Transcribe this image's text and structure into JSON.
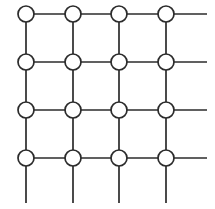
{
  "figure": {
    "type": "lattice-diagram",
    "width": 215,
    "height": 209,
    "background_color": "#ffffff"
  },
  "style": {
    "line_color": "#2b2b2b",
    "line_width": 1.7,
    "node_fill": "#ffffff",
    "node_stroke": "#2b2b2b",
    "node_stroke_width": 1.7,
    "node_radius": 8
  },
  "chart_data": {
    "type": "scatter",
    "xlabel": "",
    "ylabel": "",
    "rows": 4,
    "columns": 4,
    "column_x": [
      26,
      73,
      119,
      166
    ],
    "row_y": [
      14,
      62,
      110,
      158
    ],
    "node_count": 16,
    "nodes": [
      {
        "id": "n-r1c1",
        "row": 1,
        "col": 1,
        "x": 26,
        "y": 14
      },
      {
        "id": "n-r1c2",
        "row": 1,
        "col": 2,
        "x": 73,
        "y": 14
      },
      {
        "id": "n-r1c3",
        "row": 1,
        "col": 3,
        "x": 119,
        "y": 14
      },
      {
        "id": "n-r1c4",
        "row": 1,
        "col": 4,
        "x": 166,
        "y": 14
      },
      {
        "id": "n-r2c1",
        "row": 2,
        "col": 1,
        "x": 26,
        "y": 62
      },
      {
        "id": "n-r2c2",
        "row": 2,
        "col": 2,
        "x": 73,
        "y": 62
      },
      {
        "id": "n-r2c3",
        "row": 2,
        "col": 3,
        "x": 119,
        "y": 62
      },
      {
        "id": "n-r2c4",
        "row": 2,
        "col": 4,
        "x": 166,
        "y": 62
      },
      {
        "id": "n-r3c1",
        "row": 3,
        "col": 1,
        "x": 26,
        "y": 110
      },
      {
        "id": "n-r3c2",
        "row": 3,
        "col": 2,
        "x": 73,
        "y": 110
      },
      {
        "id": "n-r3c3",
        "row": 3,
        "col": 3,
        "x": 119,
        "y": 110
      },
      {
        "id": "n-r3c4",
        "row": 3,
        "col": 4,
        "x": 166,
        "y": 110
      },
      {
        "id": "n-r4c1",
        "row": 4,
        "col": 1,
        "x": 26,
        "y": 158
      },
      {
        "id": "n-r4c2",
        "row": 4,
        "col": 2,
        "x": 73,
        "y": 158
      },
      {
        "id": "n-r4c3",
        "row": 4,
        "col": 3,
        "x": 119,
        "y": 158
      },
      {
        "id": "n-r4c4",
        "row": 4,
        "col": 4,
        "x": 166,
        "y": 158
      }
    ],
    "horizontal_edges": [
      {
        "id": "h-r1-c1c2",
        "x1": 26,
        "y1": 14,
        "x2": 73,
        "y2": 14
      },
      {
        "id": "h-r1-c2c3",
        "x1": 73,
        "y1": 14,
        "x2": 119,
        "y2": 14
      },
      {
        "id": "h-r1-c3c4",
        "x1": 119,
        "y1": 14,
        "x2": 166,
        "y2": 14
      },
      {
        "id": "h-r2-c1c2",
        "x1": 26,
        "y1": 62,
        "x2": 73,
        "y2": 62
      },
      {
        "id": "h-r2-c2c3",
        "x1": 73,
        "y1": 62,
        "x2": 119,
        "y2": 62
      },
      {
        "id": "h-r2-c3c4",
        "x1": 119,
        "y1": 62,
        "x2": 166,
        "y2": 62
      },
      {
        "id": "h-r3-c1c2",
        "x1": 26,
        "y1": 110,
        "x2": 73,
        "y2": 110
      },
      {
        "id": "h-r3-c2c3",
        "x1": 73,
        "y1": 110,
        "x2": 119,
        "y2": 110
      },
      {
        "id": "h-r3-c3c4",
        "x1": 119,
        "y1": 110,
        "x2": 166,
        "y2": 110
      },
      {
        "id": "h-r4-c1c2",
        "x1": 26,
        "y1": 158,
        "x2": 73,
        "y2": 158
      },
      {
        "id": "h-r4-c2c3",
        "x1": 73,
        "y1": 158,
        "x2": 119,
        "y2": 158
      },
      {
        "id": "h-r4-c3c4",
        "x1": 119,
        "y1": 158,
        "x2": 166,
        "y2": 158
      }
    ],
    "vertical_edges": [
      {
        "id": "v-c1-r1r2",
        "x1": 26,
        "y1": 14,
        "x2": 26,
        "y2": 62
      },
      {
        "id": "v-c1-r2r3",
        "x1": 26,
        "y1": 62,
        "x2": 26,
        "y2": 110
      },
      {
        "id": "v-c1-r3r4",
        "x1": 26,
        "y1": 110,
        "x2": 26,
        "y2": 158
      },
      {
        "id": "v-c2-r1r2",
        "x1": 73,
        "y1": 14,
        "x2": 73,
        "y2": 62
      },
      {
        "id": "v-c2-r2r3",
        "x1": 73,
        "y1": 62,
        "x2": 73,
        "y2": 110
      },
      {
        "id": "v-c2-r3r4",
        "x1": 73,
        "y1": 110,
        "x2": 73,
        "y2": 158
      },
      {
        "id": "v-c3-r1r2",
        "x1": 119,
        "y1": 14,
        "x2": 119,
        "y2": 62
      },
      {
        "id": "v-c3-r2r3",
        "x1": 119,
        "y1": 62,
        "x2": 119,
        "y2": 110
      },
      {
        "id": "v-c3-r3r4",
        "x1": 119,
        "y1": 110,
        "x2": 119,
        "y2": 158
      },
      {
        "id": "v-c4-r1r2",
        "x1": 166,
        "y1": 14,
        "x2": 166,
        "y2": 62
      },
      {
        "id": "v-c4-r2r3",
        "x1": 166,
        "y1": 62,
        "x2": 166,
        "y2": 110
      },
      {
        "id": "v-c4-r3r4",
        "x1": 166,
        "y1": 110,
        "x2": 166,
        "y2": 158
      }
    ],
    "dangling_stubs": [
      {
        "id": "stub-right-r1",
        "direction": "right",
        "x1": 166,
        "y1": 14,
        "x2": 207,
        "y2": 14
      },
      {
        "id": "stub-right-r2",
        "direction": "right",
        "x1": 166,
        "y1": 62,
        "x2": 207,
        "y2": 62
      },
      {
        "id": "stub-right-r3",
        "direction": "right",
        "x1": 166,
        "y1": 110,
        "x2": 207,
        "y2": 110
      },
      {
        "id": "stub-right-r4",
        "direction": "right",
        "x1": 166,
        "y1": 158,
        "x2": 207,
        "y2": 158
      },
      {
        "id": "stub-down-c1",
        "direction": "down",
        "x1": 26,
        "y1": 158,
        "x2": 26,
        "y2": 203
      },
      {
        "id": "stub-down-c2",
        "direction": "down",
        "x1": 73,
        "y1": 158,
        "x2": 73,
        "y2": 203
      },
      {
        "id": "stub-down-c3",
        "direction": "down",
        "x1": 119,
        "y1": 158,
        "x2": 119,
        "y2": 203
      },
      {
        "id": "stub-down-c4",
        "direction": "down",
        "x1": 166,
        "y1": 158,
        "x2": 166,
        "y2": 203
      }
    ],
    "legend": [],
    "annotations": []
  }
}
